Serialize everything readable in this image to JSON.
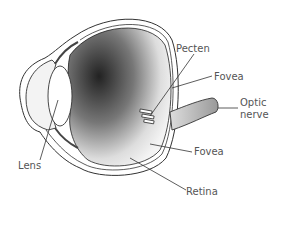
{
  "diagram": {
    "labels": {
      "pecten": "Pecten",
      "fovea_top": "Fovea",
      "optic_nerve_line1": "Optic",
      "optic_nerve_line2": "nerve",
      "fovea_bottom": "Fovea",
      "lens": "Lens",
      "retina": "Retina"
    }
  }
}
